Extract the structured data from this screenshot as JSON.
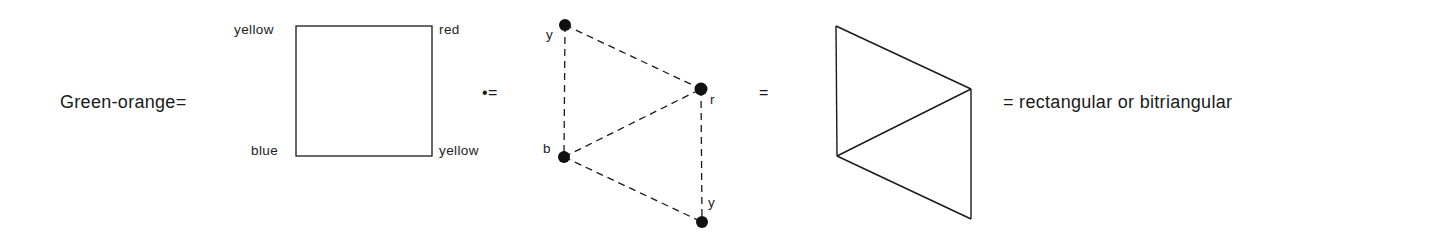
{
  "figure": {
    "lhs_label": "Green-orange=",
    "square": {
      "corners": {
        "top_left": "yellow",
        "top_right": "red",
        "bottom_left": "blue",
        "bottom_right": "yellow"
      }
    },
    "relation_1": "•=",
    "graph": {
      "nodes": [
        {
          "id": "y1",
          "label": "y"
        },
        {
          "id": "r",
          "label": "r"
        },
        {
          "id": "b",
          "label": "b"
        },
        {
          "id": "y2",
          "label": "y"
        }
      ],
      "edges": [
        [
          "y1",
          "r"
        ],
        [
          "y1",
          "b"
        ],
        [
          "b",
          "r"
        ],
        [
          "b",
          "y2"
        ],
        [
          "r",
          "y2"
        ]
      ],
      "edge_style": "dashed"
    },
    "relation_2": "=",
    "solid_figure": {
      "edges": 5,
      "edge_style": "solid"
    },
    "rhs_label": "= rectangular or bitriangular"
  },
  "colors": {
    "ink": "#1a1a1a",
    "background": "#ffffff"
  }
}
